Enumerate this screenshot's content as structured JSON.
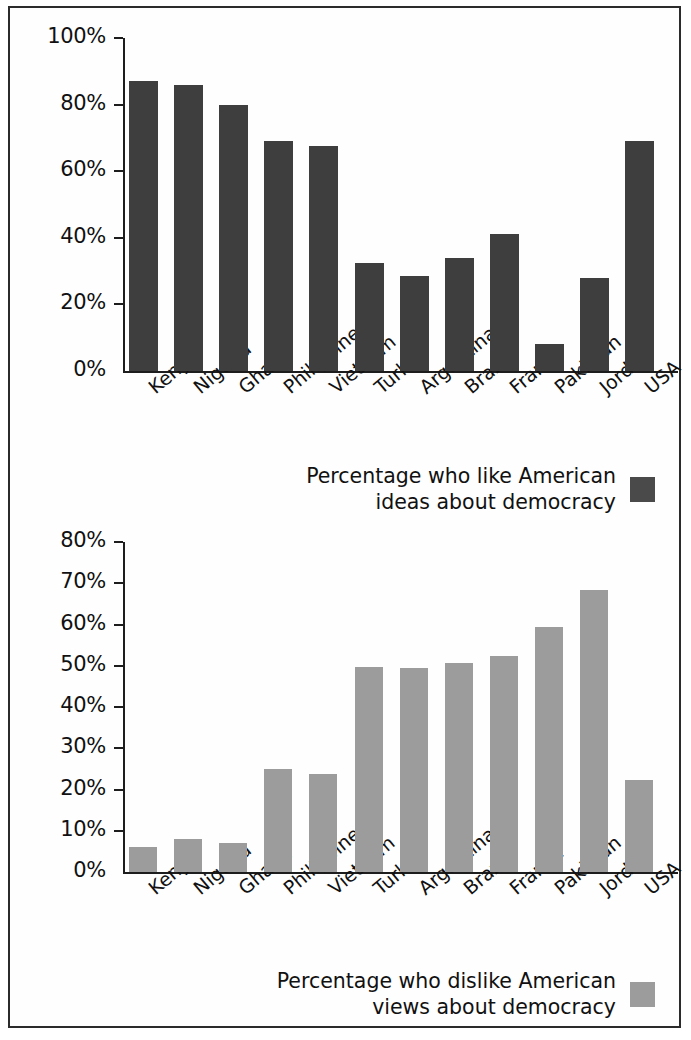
{
  "figure": {
    "panels": [
      {
        "id": "top",
        "legend_label": "Percentage who like American\nideas about democracy",
        "legend_swatch_color": "#4a4a4a"
      },
      {
        "id": "bottom",
        "legend_label": "Percentage who dislike American\nviews about democracy",
        "legend_swatch_color": "#9c9c9c"
      }
    ]
  },
  "chart_data": [
    {
      "type": "bar",
      "title": "",
      "xlabel": "",
      "ylabel": "",
      "ylim": [
        0,
        100
      ],
      "ytick_step": 20,
      "ytick_labels": [
        "0%",
        "20%",
        "40%",
        "60%",
        "80%",
        "100%"
      ],
      "grid": false,
      "legend_position": "below-right",
      "series_name": "Percentage who like American ideas about democracy",
      "bar_color": "#3e3e3e",
      "categories": [
        "Kenya",
        "Nigeria",
        "Ghana",
        "Philippines",
        "Vietnam",
        "Turkey",
        "Argentina",
        "Brazil",
        "France",
        "Pakistan",
        "Jordan",
        "USA"
      ],
      "values": [
        87,
        86,
        80,
        69,
        67.5,
        32.5,
        28.5,
        34,
        41,
        8,
        28,
        69
      ]
    },
    {
      "type": "bar",
      "title": "",
      "xlabel": "",
      "ylabel": "",
      "ylim": [
        0,
        80
      ],
      "ytick_step": 10,
      "ytick_labels": [
        "0%",
        "10%",
        "20%",
        "30%",
        "40%",
        "50%",
        "60%",
        "70%",
        "80%"
      ],
      "grid": false,
      "legend_position": "below-right",
      "series_name": "Percentage who dislike American views about democracy",
      "bar_color": "#9c9c9c",
      "categories": [
        "Kenya",
        "Nigeria",
        "Ghana",
        "Philippines",
        "Vietnam",
        "Turkey",
        "Argentina",
        "Brazil",
        "France",
        "Pakistan",
        "Jordan",
        "USA"
      ],
      "values": [
        6,
        8,
        7,
        25,
        23.8,
        49.7,
        49.5,
        50.6,
        52.4,
        59.4,
        68.3,
        22.2
      ]
    }
  ]
}
